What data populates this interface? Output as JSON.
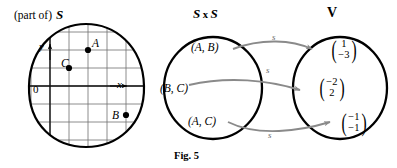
{
  "figure": {
    "caption": "Fig. 5",
    "headers": {
      "left": "(part of)",
      "left_set": "S",
      "middle_set": "S",
      "middle_times": "x",
      "middle_set2": "S",
      "right_set": "V"
    }
  },
  "plane": {
    "points": [
      {
        "name": "A",
        "label": "A"
      },
      {
        "name": "B",
        "label": "B"
      },
      {
        "name": "C",
        "label": "C"
      }
    ],
    "axes": {
      "x_label": "x",
      "y_label": "y",
      "origin_label": "0"
    }
  },
  "domain_set": {
    "label": "S x S",
    "elements": [
      {
        "id": "ab",
        "label": "(A, B)"
      },
      {
        "id": "bc",
        "label": "(B, C)"
      },
      {
        "id": "ac",
        "label": "(A, C)"
      }
    ]
  },
  "codomain_set": {
    "label": "V",
    "elements": [
      {
        "id": "v1",
        "top": "1",
        "bottom": "−3"
      },
      {
        "id": "v2",
        "top": "−2",
        "bottom": "2"
      },
      {
        "id": "v3",
        "top": "−1",
        "bottom": "−1"
      }
    ]
  },
  "mappings": [
    {
      "from": "(A, B)",
      "to": "(1, -3)",
      "label": "s"
    },
    {
      "from": "(B, C)",
      "to": "(-2, 2)",
      "label": "s"
    },
    {
      "from": "(A, C)",
      "to": "(-1, -1)",
      "label": "s"
    }
  ],
  "parens": {
    "open": "(",
    "close": ")"
  },
  "colors": {
    "ink": "#000000",
    "grid": "#7a7a7a",
    "arrow": "#8a8a8a",
    "background": "#ffffff"
  }
}
